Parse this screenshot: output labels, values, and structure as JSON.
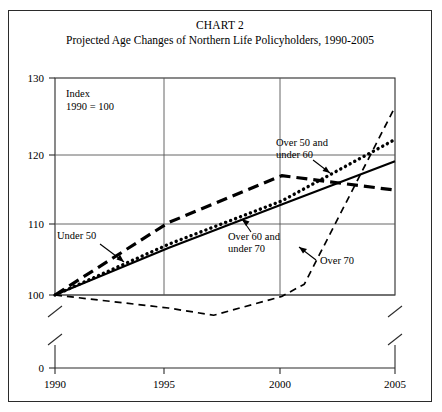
{
  "figure": {
    "title_main": "CHART 2",
    "title_sub": "Projected Age Changes of Northern Life Policyholders, 1990-2005",
    "index_note_line1": "Index",
    "index_note_line2": "1990 = 100"
  },
  "chart_data": {
    "type": "line",
    "title": "CHART 2",
    "subtitle": "Projected Age Changes of Northern Life Policyholders, 1990-2005",
    "xlabel": "",
    "ylabel": "Index (1990 = 100)",
    "xlim": [
      1990,
      2005
    ],
    "ylim": [
      100,
      130
    ],
    "y_axis_break": true,
    "y_break_from": 0,
    "y_break_to": 100,
    "x_axis_break_right": true,
    "grid": true,
    "legend": "inline-annotations",
    "xticks": [
      1990,
      1995,
      2000,
      2005
    ],
    "xticklabels": [
      "1990",
      "1995",
      "2000",
      "2005"
    ],
    "yticks": [
      0,
      100,
      110,
      120,
      130
    ],
    "yticklabels": [
      "0",
      "100",
      "110",
      "120",
      "130"
    ],
    "x": [
      1990,
      1995,
      2000,
      2005
    ],
    "series": [
      {
        "name": "Under 50",
        "style": "thick-dashed",
        "label": "Under 50",
        "x": [
          1990,
          1995,
          2000,
          2005
        ],
        "values": [
          100,
          110,
          116.5,
          114.5
        ]
      },
      {
        "name": "Over 50 and under 60",
        "style": "dotted",
        "label": "Over 50 and under 60",
        "label_line1": "Over 50 and",
        "label_line2": "under 60",
        "x": [
          1990,
          1995,
          2000,
          2005
        ],
        "values": [
          100,
          107,
          113,
          121.5
        ]
      },
      {
        "name": "Over 60 and under 70",
        "style": "solid",
        "label": "Over 60 and under 70",
        "label_line1": "Over 60 and",
        "label_line2": "under 70",
        "x": [
          1990,
          1995,
          2000,
          2005
        ],
        "values": [
          100,
          106.5,
          112.5,
          118.5
        ]
      },
      {
        "name": "Over 70",
        "style": "thin-dashed",
        "label": "Over 70",
        "x": [
          1990,
          1995,
          1997,
          2000,
          2001,
          2005
        ],
        "values": [
          100,
          98.2,
          97.2,
          99.8,
          101.5,
          126
        ]
      }
    ]
  },
  "annotations": {
    "under_50": "Under 50",
    "over_50_under_60_line1": "Over 50 and",
    "over_50_under_60_line2": "under 60",
    "over_60_under_70_line1": "Over 60 and",
    "over_60_under_70_line2": "under 70",
    "over_70": "Over 70"
  },
  "axis": {
    "y_130": "130",
    "y_120": "120",
    "y_110": "110",
    "y_100": "100",
    "y_0": "0",
    "x_1990": "1990",
    "x_1995": "1995",
    "x_2000": "2000",
    "x_2005": "2005"
  }
}
